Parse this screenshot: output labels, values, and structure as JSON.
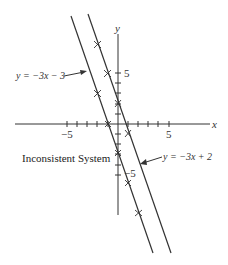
{
  "figure": {
    "caption": "Inconsistent System",
    "axes": {
      "x_label": "x",
      "y_label": "y",
      "x_tick_labels": {
        "neg": "−5",
        "pos": "5"
      },
      "y_tick_labels": {
        "pos": "5",
        "neg": "−5"
      },
      "x_range": [
        -10,
        9
      ],
      "y_range": [
        -9,
        9
      ]
    },
    "lines": [
      {
        "id": "line1",
        "label": "y = −3x − 3",
        "slope": -3,
        "intercept": -3,
        "markers": [
          [
            -2,
            3
          ],
          [
            -1,
            0
          ],
          [
            0,
            -3
          ],
          [
            1,
            -6
          ],
          [
            2,
            -9
          ]
        ]
      },
      {
        "id": "line2",
        "label": "y = −3x + 2",
        "slope": -3,
        "intercept": 2,
        "markers": [
          [
            -2,
            8
          ],
          [
            -1,
            5
          ],
          [
            0,
            2
          ],
          [
            1,
            -1
          ]
        ]
      }
    ]
  }
}
